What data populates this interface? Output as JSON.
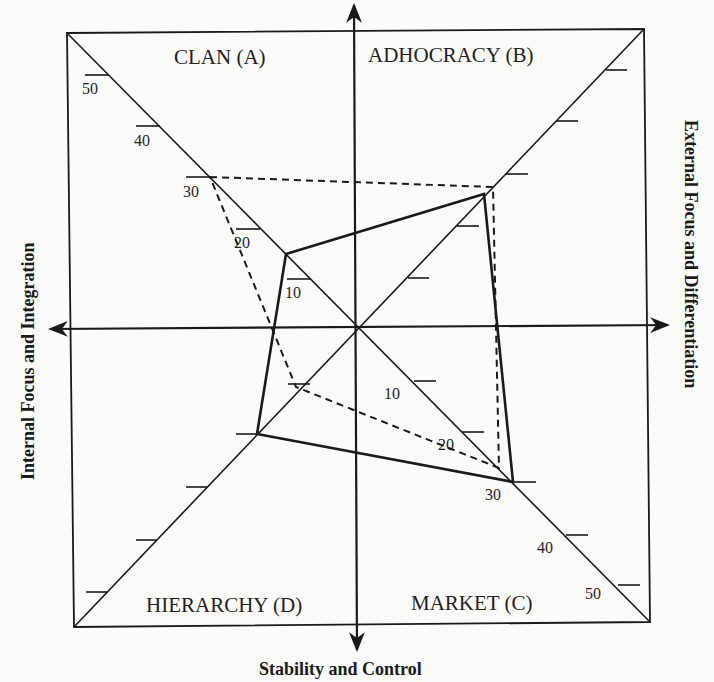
{
  "diagram": {
    "type": "competing-values-framework-radar",
    "quadrants": {
      "top_left": "CLAN (A)",
      "top_right": "ADHOCRACY (B)",
      "bottom_right": "MARKET (C)",
      "bottom_left": "HIERARCHY (D)"
    },
    "axes": {
      "left": "Internal Focus and Integration",
      "right": "External Focus and Differentiation",
      "bottom": "Stability and Control"
    },
    "scale_ticks": {
      "clan_diagonal": [
        "10",
        "20",
        "30",
        "40",
        "50"
      ],
      "market_diagonal": [
        "10",
        "20",
        "30",
        "40",
        "50"
      ]
    },
    "profiles": [
      {
        "name": "solid",
        "style": "solid",
        "A": 14,
        "B": 26,
        "C": 31,
        "D": 21
      },
      {
        "name": "dashed",
        "style": "dashed",
        "A": 30,
        "B": 28,
        "C": 28,
        "D": 13
      }
    ],
    "colors": {
      "line": "#1a1a1a",
      "background": "#fbfbf9"
    }
  }
}
